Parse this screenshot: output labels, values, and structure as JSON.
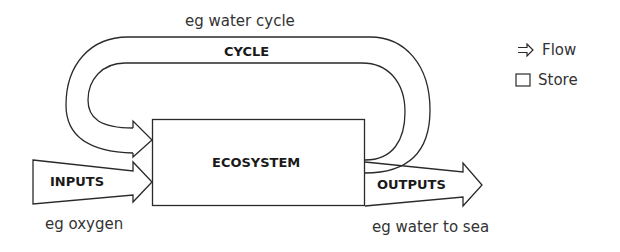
{
  "diagram": {
    "cycle": {
      "label": "CYCLE",
      "example": "eg water cycle"
    },
    "store": {
      "label": "ECOSYSTEM"
    },
    "inputs": {
      "label": "INPUTS",
      "example": "eg oxygen"
    },
    "outputs": {
      "label": "OUTPUTS",
      "example": "eg water to sea"
    }
  },
  "legend": {
    "items": [
      {
        "icon": "flow-arrow-icon",
        "label": "Flow"
      },
      {
        "icon": "store-box-icon",
        "label": "Store"
      }
    ]
  },
  "colors": {
    "stroke": "#2a2a2a",
    "background": "#ffffff"
  }
}
